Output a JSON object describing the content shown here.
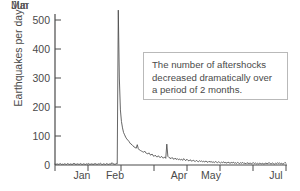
{
  "chart_data": {
    "type": "line",
    "title": "",
    "subtitle": "",
    "xlabel": "",
    "ylabel": "Earthquakes per day",
    "ylim": [
      0,
      560
    ],
    "yticks": [
      0,
      100,
      200,
      300,
      400,
      500
    ],
    "ytick_labels": [
      "0",
      "100",
      "200",
      "300",
      "400",
      "500"
    ],
    "xlim": [
      "Jan 1",
      "Aug 1"
    ],
    "xtick_labels": [
      "Jan",
      "Feb",
      "Mar",
      "Apr",
      "May",
      "Jun",
      "Jul"
    ],
    "xtick_boundaries": [
      "Jan 1",
      "Feb 1",
      "Mar 1",
      "Apr 1",
      "May 1",
      "Jun 1",
      "Jul 1",
      "Aug 1"
    ],
    "grid": false,
    "legend": false,
    "line_color": "#4a4a4a",
    "series": [
      {
        "name": "Earthquakes per day",
        "x_unit": "day index from Jan 1",
        "values": [
          3,
          2,
          4,
          2,
          3,
          5,
          2,
          3,
          2,
          4,
          3,
          2,
          5,
          3,
          2,
          4,
          2,
          3,
          6,
          3,
          2,
          4,
          3,
          2,
          5,
          3,
          2,
          4,
          3,
          2,
          4,
          3,
          5,
          2,
          3,
          4,
          2,
          3,
          5,
          3,
          2,
          4,
          3,
          6,
          3,
          2,
          4,
          3,
          2,
          5,
          3,
          2,
          4,
          3,
          8,
          4,
          3,
          2,
          5,
          4,
          534,
          300,
          190,
          150,
          128,
          112,
          104,
          96,
          90,
          86,
          82,
          76,
          72,
          70,
          66,
          62,
          60,
          58,
          70,
          56,
          52,
          50,
          48,
          46,
          44,
          48,
          42,
          40,
          38,
          42,
          36,
          34,
          38,
          32,
          30,
          34,
          29,
          28,
          32,
          27,
          26,
          30,
          25,
          24,
          28,
          23,
          72,
          30,
          26,
          24,
          22,
          26,
          21,
          20,
          24,
          19,
          22,
          18,
          21,
          17,
          20,
          16,
          22,
          18,
          15,
          20,
          16,
          14,
          18,
          15,
          13,
          17,
          14,
          12,
          16,
          13,
          11,
          15,
          12,
          14,
          11,
          13,
          10,
          14,
          11,
          9,
          13,
          10,
          12,
          9,
          11,
          8,
          12,
          10,
          8,
          11,
          9,
          7,
          10,
          8,
          11,
          7,
          9,
          6,
          10,
          8,
          6,
          9,
          7,
          10,
          6,
          8,
          5,
          9,
          7,
          5,
          8,
          6,
          9,
          5,
          7,
          4,
          8,
          6,
          5,
          7,
          4,
          6,
          8,
          5,
          7,
          4,
          6,
          3,
          7,
          5,
          4,
          6,
          3,
          5,
          7,
          4,
          6,
          8,
          5,
          4,
          7,
          5,
          3,
          6,
          4,
          8,
          5,
          7,
          4,
          6,
          3,
          5,
          9,
          6
        ]
      }
    ],
    "annotation": {
      "text": "The number of aftershocks decreased dramatically over a period of 2 months.",
      "lines": [
        "The number of aftershocks",
        "decreased dramatically over",
        "a period of 2 months."
      ],
      "box_border_color": "#b9b9b9",
      "box_background": "#ffffff"
    },
    "peak": {
      "value": 534,
      "label_approx": "~535",
      "position": "late February"
    },
    "axis_color": "#4a4a4a",
    "background": "#ffffff"
  }
}
